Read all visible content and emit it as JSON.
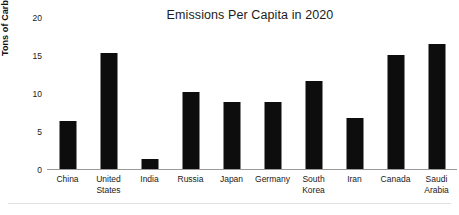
{
  "chart_data": {
    "type": "bar",
    "title": "Emissions Per Capita in 2020",
    "xlabel": "",
    "ylabel": "Tons of Carbon Emissions",
    "categories": [
      "China",
      "United States",
      "India",
      "Russia",
      "Japan",
      "Germany",
      "South Korea",
      "Iran",
      "Canada",
      "Saudi Arabia"
    ],
    "values": [
      6.5,
      15.4,
      1.5,
      10.2,
      8.9,
      8.9,
      11.7,
      6.8,
      15.1,
      16.6
    ],
    "ylim": [
      0,
      20
    ],
    "yticks": [
      0,
      5,
      10,
      15,
      20
    ],
    "ytick_labels": [
      "0",
      "5",
      "10",
      "15",
      "20"
    ],
    "grid": false,
    "legend": false,
    "bar_color": "#0d0d0d",
    "background_color": "#ffffff"
  }
}
